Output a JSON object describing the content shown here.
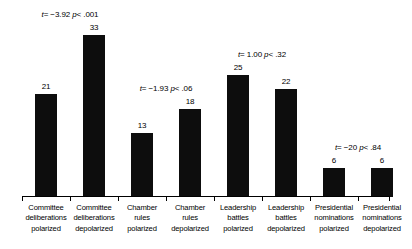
{
  "chart_data": {
    "type": "bar",
    "title": "",
    "subtitle": "",
    "xlabel": "",
    "ylabel": "",
    "ylim": [
      0,
      40
    ],
    "grid": false,
    "legend": "none",
    "bar_color": "#0d0d0d",
    "categories": [
      "Committee deliberations polarized",
      "Committee deliberations depolarized",
      "Chamber rules polarized",
      "Chamber rules depolarized",
      "Leadership battles polarized",
      "Leadership battles depolarized",
      "Presidential nominations polarized",
      "Presidential nominations depolarized"
    ],
    "category_lines": [
      [
        "Committee",
        "deliberations",
        "polarized"
      ],
      [
        "Committee",
        "deliberations",
        "depolarized"
      ],
      [
        "Chamber",
        "rules",
        "polarized"
      ],
      [
        "Chamber",
        "rules",
        "depolarized"
      ],
      [
        "Leadership",
        "battles",
        "polarized"
      ],
      [
        "Leadership",
        "battles",
        "depolarized"
      ],
      [
        "Presidential",
        "nominations",
        "polarized"
      ],
      [
        "Presidential",
        "nominations",
        "depolarized"
      ]
    ],
    "values": [
      21,
      33,
      13,
      18,
      25,
      22,
      6,
      6
    ],
    "value_labels": [
      "21",
      "33",
      "13",
      "18",
      "25",
      "22",
      "6",
      "6"
    ],
    "annotations": [
      {
        "text": "t = −3.92 p< .001",
        "t_label": "t",
        "t_value": "= −3.92",
        "p_label": "p",
        "p_value": "< .001",
        "pair": [
          0,
          1
        ]
      },
      {
        "text": "t = −1.93 p< .06",
        "t_label": "t",
        "t_value": "= −1.93",
        "p_label": "p",
        "p_value": "< .06",
        "pair": [
          2,
          3
        ]
      },
      {
        "text": "t = 1.00 p< .32",
        "t_label": "t",
        "t_value": "= 1.00",
        "p_label": "p",
        "p_value": "< .32",
        "pair": [
          4,
          5
        ]
      },
      {
        "text": "t = −20 p< .84",
        "t_label": "t",
        "t_value": "= −20",
        "p_label": "p",
        "p_value": "< .84",
        "pair": [
          6,
          7
        ]
      }
    ]
  }
}
